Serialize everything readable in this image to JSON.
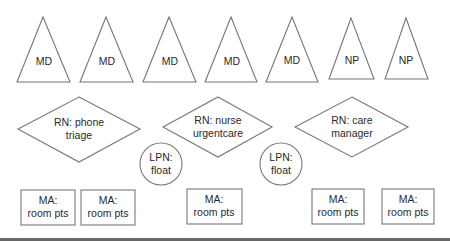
{
  "diagram": {
    "providers": [
      {
        "label": "MD",
        "shape": "triangle"
      },
      {
        "label": "MD",
        "shape": "triangle"
      },
      {
        "label": "MD",
        "shape": "triangle"
      },
      {
        "label": "MD",
        "shape": "triangle"
      },
      {
        "label": "MD",
        "shape": "triangle"
      },
      {
        "label": "NP",
        "shape": "triangle"
      },
      {
        "label": "NP",
        "shape": "triangle"
      }
    ],
    "nurses": [
      {
        "line1": "RN: phone",
        "line2": "triage",
        "shape": "diamond"
      },
      {
        "line1": "RN: nurse",
        "line2": "urgentcare",
        "shape": "diamond"
      },
      {
        "line1": "RN: care",
        "line2": "manager",
        "shape": "diamond"
      }
    ],
    "lpns": [
      {
        "line1": "LPN:",
        "line2": "float",
        "shape": "circle"
      },
      {
        "line1": "LPN:",
        "line2": "float",
        "shape": "circle"
      }
    ],
    "assistants": [
      {
        "line1": "MA:",
        "line2": "room pts",
        "shape": "rectangle"
      },
      {
        "line1": "MA:",
        "line2": "room pts",
        "shape": "rectangle"
      },
      {
        "line1": "MA:",
        "line2": "room pts",
        "shape": "rectangle"
      },
      {
        "line1": "MA:",
        "line2": "room pts",
        "shape": "rectangle"
      },
      {
        "line1": "MA:",
        "line2": "room pts",
        "shape": "rectangle"
      }
    ],
    "colors": {
      "stroke": "#777777",
      "text": "#2a2a2a",
      "rule": "#6a6a6a"
    }
  }
}
